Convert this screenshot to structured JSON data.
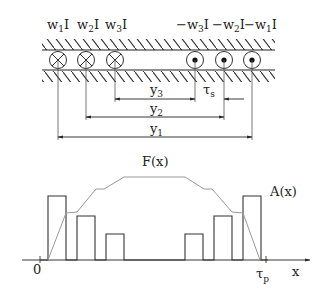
{
  "conductor": {
    "labels": [
      {
        "pre": "w",
        "sub": "1",
        "post": "I"
      },
      {
        "pre": "w",
        "sub": "2",
        "post": "I"
      },
      {
        "pre": "w",
        "sub": "3",
        "post": "I"
      },
      {
        "pre": "−w",
        "sub": "3",
        "post": "I"
      },
      {
        "pre": "−w",
        "sub": "2",
        "post": "I"
      },
      {
        "pre": "−w",
        "sub": "1",
        "post": "I"
      }
    ],
    "current_directions": [
      "into-page",
      "into-page",
      "into-page",
      "out-of-page",
      "out-of-page",
      "out-of-page"
    ]
  },
  "dimensions": {
    "y3": {
      "base": "y",
      "sub": "3"
    },
    "tau_s": {
      "base": "τ",
      "sub": "s"
    },
    "y2": {
      "base": "y",
      "sub": "2"
    },
    "y1": {
      "base": "y",
      "sub": "1"
    }
  },
  "graph": {
    "curve_label": "F(x)",
    "bars_label": "A(x)",
    "origin_label": "0",
    "end_label": {
      "base": "τ",
      "sub": "p"
    },
    "axis_label": "x"
  },
  "colors": {
    "line": "#222222",
    "curve": "#999999"
  }
}
